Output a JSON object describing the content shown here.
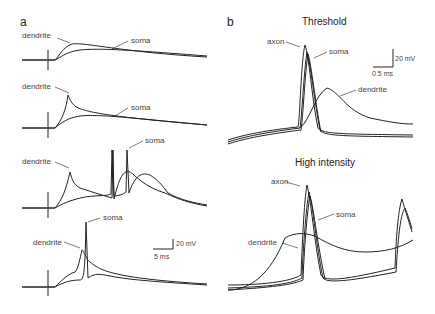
{
  "panel_a": {
    "label": "a",
    "traces": [
      {
        "dendrite_label": "dendrite",
        "soma_label": "soma"
      },
      {
        "dendrite_label": "dendrite",
        "soma_label": "soma"
      },
      {
        "dendrite_label": "dendrite",
        "soma_label": "soma"
      },
      {
        "dendrite_label": "dendrite",
        "soma_label": "soma"
      }
    ],
    "scalebar": {
      "voltage": "20 mV",
      "time": "5 ms"
    }
  },
  "panel_b": {
    "label": "b",
    "threshold": {
      "title": "Threshold",
      "axon_label": "axon",
      "soma_label": "soma",
      "dendrite_label": "dendrite",
      "scalebar": {
        "voltage": "20 mV",
        "time": "0.5 ms"
      }
    },
    "high_intensity": {
      "title": "High intensity",
      "axon_label": "axon",
      "soma_label": "soma",
      "dendrite_label": "dendrite"
    }
  }
}
